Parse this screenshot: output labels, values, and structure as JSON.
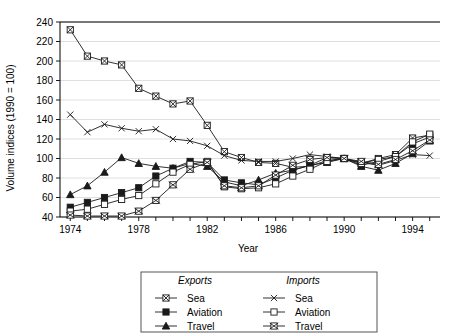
{
  "chart_data": {
    "type": "line",
    "title": "",
    "xlabel": "Year",
    "ylabel": "Volume indices (1990 = 100)",
    "xlim": [
      1973.4,
      1995.6
    ],
    "ylim": [
      40,
      240
    ],
    "ytick_step": 20,
    "yticks": [
      40,
      60,
      80,
      100,
      120,
      140,
      160,
      180,
      200,
      220,
      240
    ],
    "xticks": [
      1974,
      1975,
      1976,
      1977,
      1978,
      1979,
      1980,
      1981,
      1982,
      1983,
      1984,
      1985,
      1986,
      1987,
      1988,
      1989,
      1990,
      1991,
      1992,
      1993,
      1994,
      1995
    ],
    "xtick_labels": [
      "1974",
      "",
      "",
      "",
      "1978",
      "",
      "",
      "",
      "1982",
      "",
      "",
      "",
      "1986",
      "",
      "",
      "",
      "1990",
      "",
      "",
      "",
      "1994",
      ""
    ],
    "grid": true,
    "legend_position": "below",
    "x": [
      1974,
      1975,
      1976,
      1977,
      1978,
      1979,
      1980,
      1981,
      1982,
      1983,
      1984,
      1985,
      1986,
      1987,
      1988,
      1989,
      1990,
      1991,
      1992,
      1993,
      1994,
      1995
    ],
    "series": [
      {
        "name": "Exports Sea",
        "group": "Exports",
        "mode": "Sea",
        "marker": "square-x",
        "values": [
          232,
          205,
          200,
          196,
          172,
          164,
          156,
          159,
          134,
          107,
          101,
          96,
          95,
          91,
          92,
          98,
          100,
          95,
          100,
          104,
          121,
          124
        ]
      },
      {
        "name": "Exports Aviation",
        "group": "Exports",
        "mode": "Aviation",
        "marker": "square-filled",
        "values": [
          50,
          55,
          60,
          65,
          70,
          82,
          90,
          97,
          96,
          78,
          75,
          73,
          80,
          88,
          93,
          101,
          100,
          93,
          97,
          102,
          115,
          122
        ]
      },
      {
        "name": "Exports Travel",
        "group": "Exports",
        "mode": "Travel",
        "marker": "triangle-filled",
        "values": [
          63,
          72,
          86,
          101,
          95,
          92,
          90,
          95,
          92,
          76,
          72,
          78,
          85,
          88,
          93,
          96,
          100,
          92,
          88,
          95,
          105,
          118
        ]
      },
      {
        "name": "Imports Sea",
        "group": "Imports",
        "mode": "Sea",
        "marker": "cross-x",
        "values": [
          145,
          127,
          135,
          131,
          128,
          130,
          120,
          118,
          113,
          103,
          98,
          97,
          97,
          100,
          104,
          102,
          100,
          96,
          93,
          98,
          104,
          103
        ]
      },
      {
        "name": "Imports Aviation",
        "group": "Imports",
        "mode": "Aviation",
        "marker": "square-open",
        "values": [
          46,
          48,
          53,
          58,
          62,
          74,
          86,
          94,
          97,
          71,
          69,
          70,
          74,
          82,
          89,
          97,
          100,
          95,
          99,
          102,
          117,
          125
        ]
      },
      {
        "name": "Imports Travel",
        "group": "Imports",
        "mode": "Travel",
        "marker": "square-cross",
        "values": [
          42,
          41,
          41,
          41,
          46,
          57,
          73,
          89,
          96,
          72,
          70,
          72,
          83,
          93,
          99,
          101,
          100,
          97,
          94,
          99,
          108,
          119
        ]
      }
    ]
  },
  "legend": {
    "columns": [
      {
        "title": "Exports",
        "entries": [
          {
            "label": "Sea",
            "marker": "square-x"
          },
          {
            "label": "Aviation",
            "marker": "square-filled"
          },
          {
            "label": "Travel",
            "marker": "triangle-filled"
          }
        ]
      },
      {
        "title": "Imports",
        "entries": [
          {
            "label": "Sea",
            "marker": "cross-x"
          },
          {
            "label": "Aviation",
            "marker": "square-open"
          },
          {
            "label": "Travel",
            "marker": "square-cross"
          }
        ]
      }
    ]
  },
  "colors": {
    "line": "#1a1a1a",
    "grid": "#c9c9c9",
    "axis": "#000000",
    "background": "#ffffff"
  }
}
